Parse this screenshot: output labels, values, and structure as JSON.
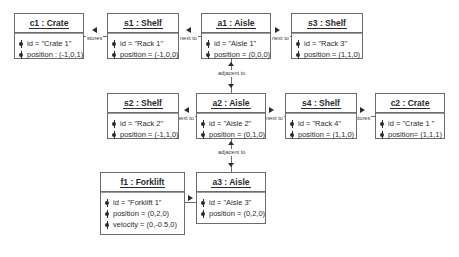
{
  "diagram": {
    "kind": "uml-object-diagram",
    "line_color": "#6b6b6b",
    "text_color": "#2b2b2b",
    "background": "#ffffff"
  },
  "objects": [
    {
      "key": "c1",
      "title": "c1 : Crate",
      "attributes": [
        "id = \"Crate 1\"",
        "position : (-1,0,1)"
      ],
      "x": 14,
      "y": 13,
      "w": 70,
      "h": 46
    },
    {
      "key": "s1",
      "title": "s1  : Shelf",
      "attributes": [
        "id = \"Rack 1\"",
        "position = (-1,0,0)"
      ],
      "x": 107,
      "y": 13,
      "w": 72,
      "h": 46
    },
    {
      "key": "a1",
      "title": "a1 : Aisle",
      "attributes": [
        "id = \"Aisle 1\"",
        "position = (0,0,0)"
      ],
      "x": 201,
      "y": 13,
      "w": 70,
      "h": 46
    },
    {
      "key": "s3",
      "title": "s3  : Shelf",
      "attributes": [
        "id = \"Rack 3\"",
        "position = (1,1,0)"
      ],
      "x": 291,
      "y": 13,
      "w": 72,
      "h": 46
    },
    {
      "key": "s2",
      "title": "s2  : Shelf",
      "attributes": [
        "id = \"Rack 2\"",
        "position = (-1,1,0)"
      ],
      "x": 107,
      "y": 93,
      "w": 72,
      "h": 46
    },
    {
      "key": "a2",
      "title": "a2 : Aisle",
      "attributes": [
        "id = \"Aisle 2\"",
        "position = (0,1,0)"
      ],
      "x": 196,
      "y": 93,
      "w": 70,
      "h": 46
    },
    {
      "key": "s4",
      "title": "s4  : Shelf",
      "attributes": [
        "id = \"Rack 4\"",
        "position = (1,1,0)"
      ],
      "x": 285,
      "y": 93,
      "w": 72,
      "h": 46
    },
    {
      "key": "c2",
      "title": "c2 : Crate",
      "attributes": [
        "id =  \"Crate 1 \"",
        "position= (1,1,1)"
      ],
      "x": 375,
      "y": 93,
      "w": 70,
      "h": 46
    },
    {
      "key": "f1",
      "title": "f1 : Forklift",
      "attributes": [
        "id = \"Forklift 1\"",
        "position = (0,2,0)",
        "velocity = (0,-0.5,0)"
      ],
      "x": 100,
      "y": 172,
      "w": 85,
      "h": 63
    },
    {
      "key": "a3",
      "title": "a3 : Aisle",
      "attributes": [
        "id = \"Aisle 3\"",
        "position = (0,2,0)"
      ],
      "x": 196,
      "y": 172,
      "w": 70,
      "h": 52
    }
  ],
  "links": [
    {
      "key": "c1-s1",
      "label": "stores",
      "from": "c1",
      "to": "s1",
      "direction": "left"
    },
    {
      "key": "s1-a1",
      "label": "next to",
      "from": "s1",
      "to": "a1",
      "direction": "left"
    },
    {
      "key": "a1-s3",
      "label": "next to",
      "from": "a1",
      "to": "s3",
      "direction": "right"
    },
    {
      "key": "a1-a2",
      "label": "adjacent to",
      "from": "a1",
      "to": "a2",
      "direction": "both-vertical"
    },
    {
      "key": "s2-a2",
      "label": "next to",
      "from": "s2",
      "to": "a2",
      "direction": "left"
    },
    {
      "key": "a2-s4",
      "label": "next to",
      "from": "a2",
      "to": "s4",
      "direction": "right"
    },
    {
      "key": "s4-c2",
      "label": "stores",
      "from": "s4",
      "to": "c2",
      "direction": "right"
    },
    {
      "key": "a2-a3",
      "label": "adjacent to",
      "from": "a2",
      "to": "a3",
      "direction": "both-vertical"
    },
    {
      "key": "f1-a3",
      "label": "in",
      "from": "f1",
      "to": "a3",
      "direction": "right"
    }
  ]
}
